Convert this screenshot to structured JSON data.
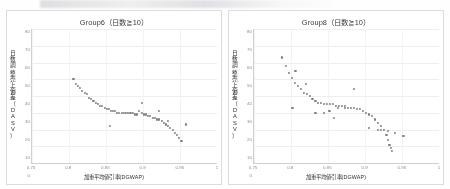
{
  "page": {
    "background_color": "#fefeff",
    "border_color": "#dcdcdc",
    "point_color": "#6f6f74",
    "top_artifact": "scan-smudge"
  },
  "charts": [
    {
      "id": "group6",
      "title": "Group6（日数≧10）",
      "xlabel": "加重平均値引率(DGWAP)",
      "ylabel": "日数調整売上偏差（DASV）",
      "ylabel_chars": "日数調整売上偏差（DASV）"
    },
    {
      "id": "group8",
      "title": "Group8（日数≧10）",
      "xlabel": "加重平均値引率(DGWAP)",
      "ylabel": "日数調整売上偏差（DASV）",
      "ylabel_chars": "日数調整売上偏差（DASV）"
    }
  ],
  "chart_data": [
    {
      "type": "scatter",
      "title": "Group6（日数≧10）",
      "xlabel": "加重平均値引率(DGWAP)",
      "ylabel": "日数調整売上偏差（DASV）",
      "xlim": [
        0.75,
        1.0
      ],
      "ylim": [
        0,
        80
      ],
      "xticks": [
        0.75,
        0.8,
        0.85,
        0.9,
        0.95,
        1
      ],
      "xticklabels": [
        "0.75",
        "0.8",
        "0.85",
        "0.9",
        "0.95",
        "1"
      ],
      "yticks": [
        0,
        10,
        20,
        30,
        40,
        50,
        60,
        70,
        80
      ],
      "yticklabels": [
        "0",
        "10",
        "20",
        "30",
        "40",
        "50",
        "60",
        "70",
        "80"
      ],
      "grid": true,
      "legend": null,
      "x": [
        0.806,
        0.81,
        0.812,
        0.815,
        0.818,
        0.821,
        0.824,
        0.827,
        0.83,
        0.833,
        0.836,
        0.839,
        0.842,
        0.845,
        0.848,
        0.851,
        0.854,
        0.857,
        0.86,
        0.862,
        0.865,
        0.868,
        0.871,
        0.874,
        0.877,
        0.88,
        0.883,
        0.886,
        0.889,
        0.892,
        0.895,
        0.898,
        0.901,
        0.904,
        0.907,
        0.91,
        0.913,
        0.916,
        0.919,
        0.922,
        0.925,
        0.928,
        0.931,
        0.934,
        0.937,
        0.94,
        0.943,
        0.946,
        0.949,
        0.952,
        0.855,
        0.898,
        0.921,
        0.934,
        0.958
      ],
      "y": [
        50,
        47,
        46,
        45,
        43,
        42,
        41,
        39,
        38,
        37,
        36,
        35,
        34,
        34,
        33,
        32,
        32,
        31,
        31,
        31,
        30,
        30,
        30,
        30,
        30,
        30,
        30,
        30,
        29,
        29,
        31,
        30,
        29,
        29,
        28,
        28,
        27,
        27,
        26,
        26,
        25,
        24,
        23,
        22,
        21,
        20,
        18,
        17,
        15,
        13,
        22,
        36,
        31,
        25,
        23
      ]
    },
    {
      "type": "scatter",
      "title": "Group8（日数≧10）",
      "xlabel": "加重平均値引率(DGWAP)",
      "ylabel": "日数調整売上偏差（DASV）",
      "xlim": [
        0.75,
        1.0
      ],
      "ylim": [
        0,
        80
      ],
      "xticks": [
        0.75,
        0.8,
        0.85,
        0.9,
        0.95,
        1
      ],
      "xticklabels": [
        "0.75",
        "0.8",
        "0.85",
        "0.9",
        "0.95",
        "1"
      ],
      "yticks": [
        0,
        10,
        20,
        30,
        40,
        50,
        60,
        70,
        80
      ],
      "yticklabels": [
        "0",
        "10",
        "20",
        "30",
        "40",
        "50",
        "60",
        "70",
        "80"
      ],
      "grid": true,
      "legend": null,
      "x": [
        0.788,
        0.793,
        0.797,
        0.801,
        0.805,
        0.809,
        0.813,
        0.817,
        0.821,
        0.825,
        0.829,
        0.833,
        0.837,
        0.841,
        0.845,
        0.849,
        0.853,
        0.857,
        0.861,
        0.865,
        0.869,
        0.873,
        0.877,
        0.881,
        0.885,
        0.889,
        0.893,
        0.897,
        0.901,
        0.905,
        0.909,
        0.913,
        0.917,
        0.921,
        0.925,
        0.929,
        0.931,
        0.933,
        0.935,
        0.937,
        0.806,
        0.802,
        0.82,
        0.833,
        0.845,
        0.852,
        0.858,
        0.864,
        0.873,
        0.885,
        0.905,
        0.917,
        0.921,
        0.931,
        0.941,
        0.952
      ],
      "y": [
        63,
        58,
        54,
        51,
        48,
        46,
        44,
        42,
        41,
        40,
        38,
        37,
        36,
        36,
        35,
        35,
        35,
        35,
        34,
        34,
        34,
        34,
        33,
        33,
        33,
        32,
        32,
        31,
        30,
        29,
        28,
        26,
        24,
        22,
        20,
        17,
        14,
        11,
        9,
        7,
        55,
        33,
        47,
        30,
        30,
        31,
        27,
        33,
        33,
        44,
        21,
        20,
        20,
        19,
        18,
        16
      ]
    }
  ]
}
